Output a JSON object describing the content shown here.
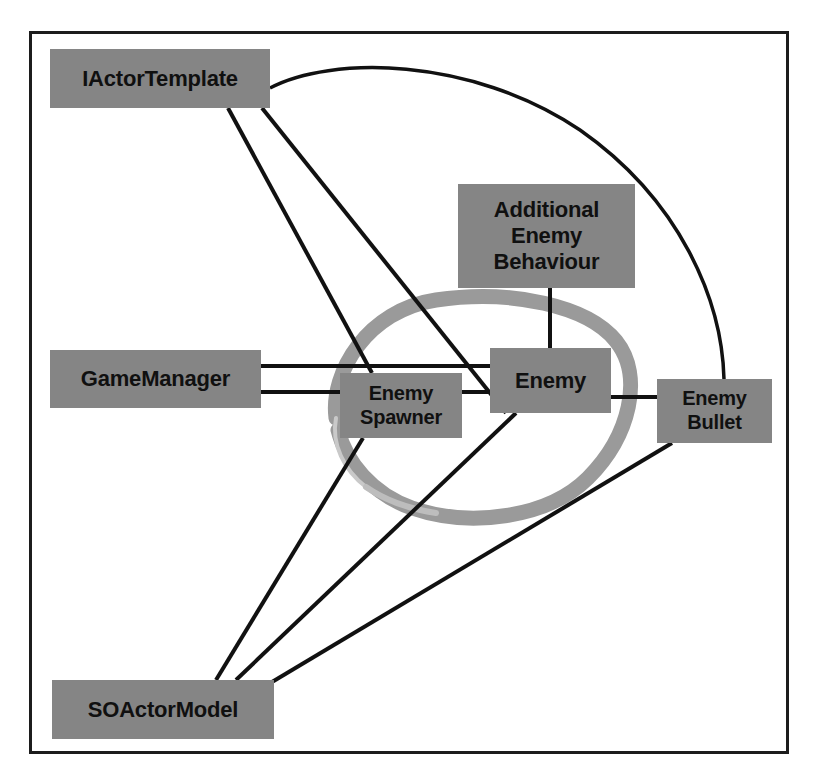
{
  "diagram": {
    "frame": {
      "border_color": "#1c1c1c"
    },
    "palette": {
      "node_fill": "#858585",
      "node_text": "#101010",
      "edge_color": "#111111",
      "highlight_ellipse": "#9a9a9a",
      "background": "#ffffff"
    },
    "nodes": [
      {
        "id": "iactortemplate",
        "label": "IActorTemplate",
        "x": 50,
        "y": 49,
        "w": 220,
        "h": 59
      },
      {
        "id": "additional",
        "label": "Additional\nEnemy\nBehaviour",
        "x": 458,
        "y": 184,
        "w": 177,
        "h": 104
      },
      {
        "id": "gamemanager",
        "label": "GameManager",
        "x": 50,
        "y": 350,
        "w": 211,
        "h": 58
      },
      {
        "id": "enemyspawner",
        "label": "Enemy\nSpawner",
        "x": 340,
        "y": 373,
        "w": 122,
        "h": 65
      },
      {
        "id": "enemy",
        "label": "Enemy",
        "x": 490,
        "y": 348,
        "w": 121,
        "h": 65
      },
      {
        "id": "enemybullet",
        "label": "Enemy\nBullet",
        "x": 657,
        "y": 379,
        "w": 115,
        "h": 64
      },
      {
        "id": "soactormodel",
        "label": "SOActorModel",
        "x": 52,
        "y": 680,
        "w": 222,
        "h": 59
      }
    ],
    "edges": [
      {
        "from": "iactortemplate",
        "to": "enemybullet",
        "kind": "arc"
      },
      {
        "from": "iactortemplate",
        "to": "enemyspawner",
        "kind": "line"
      },
      {
        "from": "iactortemplate",
        "to": "enemy",
        "kind": "line"
      },
      {
        "from": "gamemanager",
        "to": "enemy",
        "kind": "line"
      },
      {
        "from": "gamemanager",
        "to": "enemyspawner",
        "kind": "line"
      },
      {
        "from": "enemyspawner",
        "to": "enemy",
        "kind": "line"
      },
      {
        "from": "additional",
        "to": "enemy",
        "kind": "line"
      },
      {
        "from": "enemy",
        "to": "enemybullet",
        "kind": "line"
      },
      {
        "from": "enemyspawner",
        "to": "soactormodel",
        "kind": "line"
      },
      {
        "from": "enemy",
        "to": "soactormodel",
        "kind": "line"
      },
      {
        "from": "enemybullet",
        "to": "soactormodel",
        "kind": "line"
      }
    ],
    "annotation": {
      "type": "hand-drawn-ellipse",
      "encircles": [
        "enemyspawner",
        "enemy"
      ],
      "color": "#9a9a9a"
    }
  }
}
